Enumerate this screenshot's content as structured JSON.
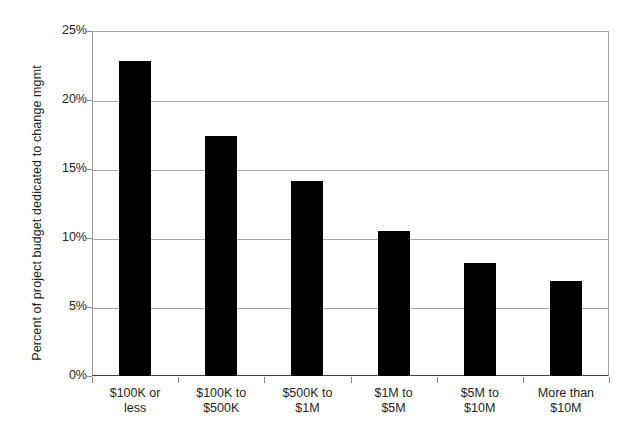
{
  "chart_data": {
    "type": "bar",
    "title": "",
    "subtitle": "",
    "xlabel": "",
    "ylabel": "Percent of project budget dedicated to change mgmt",
    "categories": [
      "$100K or less",
      "$100K to $500K",
      "$500K to $1M",
      "$1M to $5M",
      "$5M to $10M",
      "More than $10M"
    ],
    "category_lines": [
      [
        "$100K or",
        "less"
      ],
      [
        "$100K to",
        "$500K"
      ],
      [
        "$500K to",
        "$1M"
      ],
      [
        "$1M to",
        "$5M"
      ],
      [
        "$5M to",
        "$10M"
      ],
      [
        "More than",
        "$10M"
      ]
    ],
    "values": [
      22.8,
      17.4,
      14.1,
      10.5,
      8.2,
      6.9
    ],
    "value_labels": [
      "22.8%",
      "17.4%",
      "14.1%",
      "10.5%",
      "8.2%",
      "6.9%"
    ],
    "ylim": [
      0,
      25
    ],
    "ytick_values": [
      0,
      5,
      10,
      15,
      20,
      25
    ],
    "ytick_labels": [
      "0%",
      "5%",
      "10%",
      "15%",
      "20%",
      "25%"
    ],
    "grid": true,
    "grid_axis": "y",
    "legend": false,
    "legend_position": "none",
    "series_name": "Percent of project budget dedicated to change mgmt",
    "bar_color": "#000000",
    "grid_color": "#a6a6a6",
    "axis_color": "#3f3f3f",
    "background_color": "#ffffff",
    "text_color": "#231f20"
  }
}
